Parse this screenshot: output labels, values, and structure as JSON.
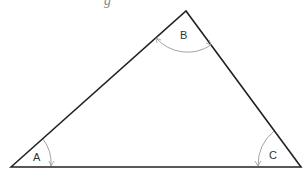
{
  "figure": {
    "type": "triangle",
    "top_cut_text": "g",
    "vertices": {
      "A": {
        "x": 11,
        "y": 167
      },
      "B": {
        "x": 186,
        "y": 11
      },
      "C": {
        "x": 301,
        "y": 167
      }
    },
    "angle_labels": {
      "A": "A",
      "B": "B",
      "C": "C"
    },
    "colors": {
      "edge": "#222222",
      "arc": "#999999",
      "label": "#333333"
    }
  }
}
